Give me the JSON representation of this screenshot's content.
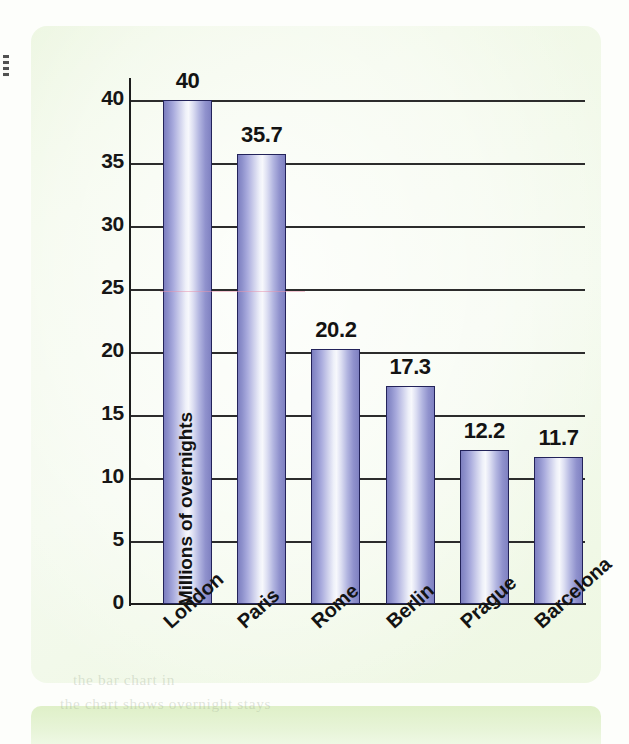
{
  "chart_data": {
    "type": "bar",
    "title": "",
    "subtitle": "",
    "xlabel": "",
    "ylabel": "Millions of overnights",
    "categories": [
      "London",
      "Paris",
      "Rome",
      "Berlin",
      "Prague",
      "Barcelona"
    ],
    "values": [
      40,
      35.7,
      20.2,
      17.3,
      12.2,
      11.7
    ],
    "value_labels": [
      "40",
      "35.7",
      "20.2",
      "17.3",
      "12.2",
      "11.7"
    ],
    "ylim": [
      0,
      40
    ],
    "yticks": [
      0,
      5,
      10,
      15,
      20,
      25,
      30,
      35,
      40
    ],
    "ytick_labels": [
      "0",
      "5",
      "10",
      "15",
      "20",
      "25",
      "30",
      "35",
      "40"
    ],
    "grid": "horizontal",
    "legend": "none",
    "bar_style": "cylinder-gradient",
    "xtick_rotation_deg": -42
  },
  "colors": {
    "bar_edge": "#7d7fc0",
    "bar_highlight": "#f7f8fc",
    "bar_outline": "#23235a",
    "axis": "#1d1d1d",
    "gridline": "#2c2c2c",
    "panel": "#eef7e2",
    "page": "#fdfefb",
    "bottom_band": "#dff0c8",
    "text": "#131313"
  },
  "artifacts": {
    "showthrough_line_1": "the bar chart in",
    "showthrough_line_2": "the  chart  shows  overnight  stays",
    "edge_mark": "binding-edge-mark"
  }
}
